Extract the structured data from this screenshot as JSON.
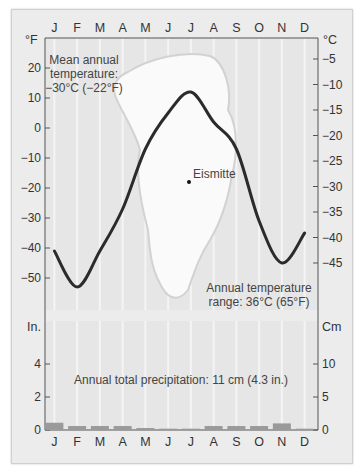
{
  "station": "Eismitte",
  "temperature_panel": {
    "left_axis_unit": "°F",
    "right_axis_unit": "°C",
    "left_ticks": [
      "20",
      "10",
      "0",
      "-10",
      "-20",
      "-30",
      "-40",
      "-50"
    ],
    "right_ticks": [
      "-5",
      "-10",
      "-15",
      "-20",
      "-25",
      "-30",
      "-35",
      "-40",
      "-45"
    ],
    "annotation_mean_line1": "Mean annual",
    "annotation_mean_line2": "temperature:",
    "annotation_mean_line3": "−30°C (−22°F)",
    "annotation_range_line1": "Annual temperature",
    "annotation_range_line2": "range: 36°C (65°F)",
    "station_label": "Eismitte"
  },
  "precipitation_panel": {
    "left_axis_unit": "In.",
    "right_axis_unit": "Cm",
    "left_ticks": [
      "4",
      "2",
      "0"
    ],
    "right_ticks": [
      "10",
      "5",
      "0"
    ],
    "annotation": "Annual total precipitation: 11 cm (4.3 in.)"
  },
  "months": [
    "J",
    "F",
    "M",
    "A",
    "M",
    "J",
    "J",
    "A",
    "S",
    "O",
    "N",
    "D"
  ],
  "chart_data": [
    {
      "type": "line",
      "title": "Eismitte temperature",
      "categories": [
        "J",
        "F",
        "M",
        "A",
        "M",
        "J",
        "J",
        "A",
        "S",
        "O",
        "N",
        "D"
      ],
      "series": [
        {
          "name": "Temperature (°F)",
          "values": [
            -41,
            -53,
            -41,
            -27,
            -7,
            5,
            12,
            2,
            -7,
            -31,
            -45,
            -35
          ]
        },
        {
          "name": "Temperature (°C)",
          "values": [
            -41,
            -47,
            -41,
            -33,
            -22,
            -15,
            -11,
            -17,
            -22,
            -35,
            -43,
            -37
          ]
        }
      ],
      "ylabel_left": "°F",
      "ylabel_right": "°C",
      "ylim_f": [
        -60,
        25
      ],
      "ylim_c": [
        -50,
        -4
      ],
      "annotations": [
        "Mean annual temperature: −30°C (−22°F)",
        "Annual temperature range: 36°C (65°F)",
        "Eismitte"
      ],
      "grid": true
    },
    {
      "type": "bar",
      "title": "Eismitte precipitation",
      "categories": [
        "J",
        "F",
        "M",
        "A",
        "M",
        "J",
        "J",
        "A",
        "S",
        "O",
        "N",
        "D"
      ],
      "values_cm": [
        1.1,
        0.6,
        0.6,
        0.6,
        0.3,
        0.2,
        0.2,
        0.6,
        0.6,
        0.6,
        1.0,
        0.2
      ],
      "ylabel_left": "In.",
      "ylabel_right": "Cm",
      "ylim_in": [
        0,
        6
      ],
      "ylim_cm": [
        0,
        15
      ],
      "annotations": [
        "Annual total precipitation: 11 cm (4.3 in.)"
      ]
    }
  ],
  "colors": {
    "curve": "#2b2b2b",
    "bars": "#9a9a9a",
    "panel_bg": "#e6e6e6",
    "map": "#fafafa"
  }
}
